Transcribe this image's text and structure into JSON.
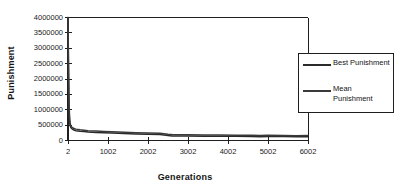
{
  "chart_data": {
    "type": "line",
    "title": "",
    "xlabel": "Generations",
    "ylabel": "Punishment",
    "xlim": [
      2,
      6002
    ],
    "ylim": [
      0,
      4000000
    ],
    "grid": false,
    "legend_position": "right",
    "xticks": [
      "2",
      "1002",
      "2002",
      "3002",
      "4002",
      "5002",
      "6002"
    ],
    "xtick_values": [
      2,
      1002,
      2002,
      3002,
      4002,
      5002,
      6002
    ],
    "yticks": [
      "0",
      "500000",
      "1000000",
      "1500000",
      "2000000",
      "2500000",
      "3000000",
      "3500000",
      "4000000"
    ],
    "ytick_values": [
      0,
      500000,
      1000000,
      1500000,
      2000000,
      2500000,
      3000000,
      3500000,
      4000000
    ],
    "series": [
      {
        "name": "Best Punishment",
        "color": "#2a2a2a",
        "x": [
          2,
          12,
          22,
          32,
          42,
          52,
          72,
          102,
          152,
          202,
          302,
          402,
          502,
          702,
          902,
          1102,
          1402,
          1702,
          2002,
          2302,
          2502,
          2602,
          3002,
          3402,
          3802,
          4202,
          4602,
          4802,
          5002,
          5402,
          5702,
          6002
        ],
        "y": [
          4000000,
          2600000,
          1500000,
          900000,
          620000,
          500000,
          420000,
          380000,
          340000,
          320000,
          300000,
          290000,
          275000,
          260000,
          250000,
          240000,
          225000,
          215000,
          205000,
          195000,
          160000,
          150000,
          145000,
          140000,
          138000,
          135000,
          132000,
          120000,
          130000,
          128000,
          118000,
          125000
        ]
      },
      {
        "name": "Mean Punishment",
        "color": "#3a3a3a",
        "x": [
          2,
          12,
          22,
          32,
          42,
          52,
          72,
          102,
          152,
          202,
          302,
          402,
          502,
          702,
          902,
          1102,
          1402,
          1702,
          2002,
          2302,
          2502,
          2602,
          3002,
          3402,
          3802,
          4202,
          4602,
          4802,
          5002,
          5402,
          5702,
          6002
        ],
        "y": [
          4000000,
          2750000,
          1700000,
          1050000,
          740000,
          590000,
          470000,
          425000,
          390000,
          370000,
          350000,
          335000,
          320000,
          305000,
          295000,
          285000,
          268000,
          255000,
          245000,
          235000,
          200000,
          195000,
          190000,
          182000,
          178000,
          172000,
          168000,
          162000,
          168000,
          165000,
          158000,
          160000
        ]
      }
    ]
  },
  "legend": {
    "entries": [
      {
        "label": "Best Punishment"
      },
      {
        "label": "Mean Punishment"
      }
    ]
  },
  "axes": {
    "x_title": "Generations",
    "y_title": "Punishment"
  }
}
